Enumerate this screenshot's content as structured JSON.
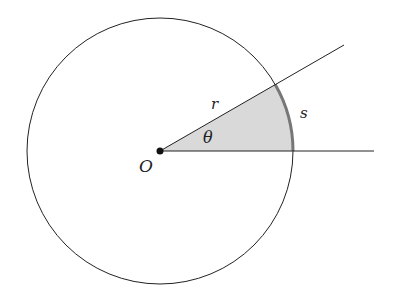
{
  "diagram": {
    "labels": {
      "origin": "O",
      "radius": "r",
      "arc": "s",
      "angle": "θ"
    },
    "geometry": {
      "center": [
        160,
        151
      ],
      "radius": 133,
      "angle_deg": 30
    },
    "colors": {
      "stroke": "#222222",
      "sector_fill": "#d9d9d9",
      "arc_highlight": "#777777"
    }
  }
}
